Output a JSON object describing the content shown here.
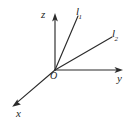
{
  "figure": {
    "type": "3d-coordinate-axes-diagram",
    "background_color": "#ffffff",
    "stroke_color": "#2b2b2b",
    "width": 131,
    "height": 126,
    "origin": {
      "label": "O",
      "x": 55,
      "y": 70
    },
    "axes": [
      {
        "name": "z-axis",
        "label": "z",
        "from": {
          "x": 55,
          "y": 70
        },
        "to": {
          "x": 55,
          "y": 14
        },
        "arrow": true,
        "label_pos": {
          "x": 41,
          "y": 9
        }
      },
      {
        "name": "y-axis",
        "label": "y",
        "from": {
          "x": 55,
          "y": 70
        },
        "to": {
          "x": 122,
          "y": 70
        },
        "arrow": true,
        "label_pos": {
          "x": 117,
          "y": 73
        }
      },
      {
        "name": "x-axis",
        "label": "x",
        "from": {
          "x": 55,
          "y": 70
        },
        "to": {
          "x": 13,
          "y": 106
        },
        "arrow": true,
        "label_pos": {
          "x": 16,
          "y": 108
        }
      }
    ],
    "rays": [
      {
        "name": "ray-l1",
        "label": "l",
        "subscript": "1",
        "from": {
          "x": 55,
          "y": 70
        },
        "to": {
          "x": 78,
          "y": 16
        },
        "arrow": false,
        "label_pos": {
          "x": 76,
          "y": 6
        }
      },
      {
        "name": "ray-l2",
        "label": "l",
        "subscript": "2",
        "from": {
          "x": 55,
          "y": 70
        },
        "to": {
          "x": 112,
          "y": 37
        },
        "arrow": false,
        "label_pos": {
          "x": 112,
          "y": 28
        }
      }
    ]
  }
}
